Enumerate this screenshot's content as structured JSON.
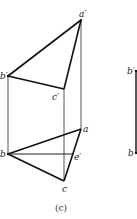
{
  "figure": {
    "caption": "(c)",
    "line_color": "#111111",
    "thin_color": "#444444"
  },
  "points": {
    "a_prime": {
      "label": "a′",
      "x": 81,
      "y": 20
    },
    "b_prime": {
      "label": "b′",
      "x": 8,
      "y": 76
    },
    "c_prime": {
      "label": "c′",
      "x": 64,
      "y": 89
    },
    "a": {
      "label": "a",
      "x": 81,
      "y": 129
    },
    "b": {
      "label": "b",
      "x": 8,
      "y": 154
    },
    "c": {
      "label": "c",
      "x": 64,
      "y": 181
    },
    "e_prime": {
      "label": "e′",
      "x": 74,
      "y": 154
    }
  },
  "right_partial": {
    "top_label": "b′",
    "bottom_label": "b"
  }
}
